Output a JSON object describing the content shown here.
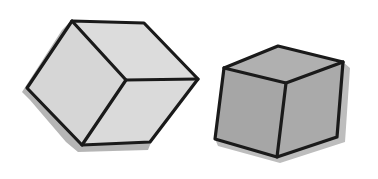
{
  "illustration": {
    "description": "Two hand-drawn cubes",
    "left_cube": {
      "face_color": "#d9d9d9",
      "shadow_color": "#a8a8a8",
      "outline_color": "#1a1a1a"
    },
    "right_cube": {
      "face_color": "#a6a6a6",
      "shadow_color": "#bdbdbd",
      "outline_color": "#1a1a1a"
    }
  }
}
